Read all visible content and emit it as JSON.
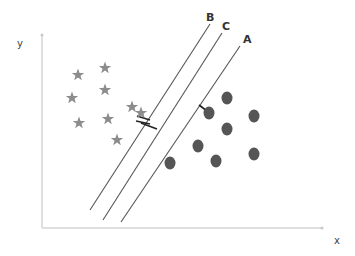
{
  "diagram": {
    "title": "",
    "axes": {
      "x_label": "x",
      "y_label": "y",
      "color": "#d4d4d4"
    },
    "hyperplanes": [
      {
        "label": "B",
        "x1": 90,
        "y1": 210,
        "x2": 210,
        "y2": 24,
        "label_x": 206,
        "label_y": 12
      },
      {
        "label": "C",
        "x1": 103,
        "y1": 220,
        "x2": 222,
        "y2": 33,
        "label_x": 222,
        "label_y": 21
      },
      {
        "label": "A",
        "x1": 121,
        "y1": 222,
        "x2": 240,
        "y2": 46,
        "label_x": 243,
        "label_y": 34
      }
    ],
    "line_color": "#555555",
    "class_stars": {
      "color": "#8c8c8c",
      "points": [
        [
          78,
          75
        ],
        [
          105,
          68
        ],
        [
          72,
          98
        ],
        [
          105,
          90
        ],
        [
          132,
          107
        ],
        [
          79,
          123
        ],
        [
          108,
          119
        ],
        [
          117,
          140
        ],
        [
          141,
          113
        ]
      ]
    },
    "class_circles": {
      "color": "#555555",
      "points": [
        [
          227,
          98
        ],
        [
          209,
          113
        ],
        [
          254,
          116
        ],
        [
          227,
          129
        ],
        [
          198,
          146
        ],
        [
          254,
          154
        ],
        [
          216,
          161
        ],
        [
          170,
          163
        ]
      ]
    },
    "margin_marks": [
      {
        "x1": 137,
        "y1": 116,
        "x2": 150,
        "y2": 120
      },
      {
        "x1": 136,
        "y1": 121,
        "x2": 150,
        "y2": 124
      },
      {
        "x1": 141,
        "y1": 123,
        "x2": 157,
        "y2": 129
      },
      {
        "x1": 199,
        "y1": 105,
        "x2": 207,
        "y2": 111
      }
    ]
  }
}
